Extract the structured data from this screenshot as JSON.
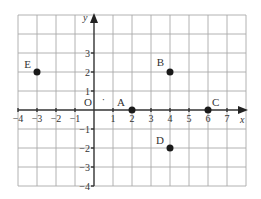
{
  "chart_data": {
    "type": "scatter",
    "title": "",
    "xlabel": "x",
    "ylabel": "y",
    "origin_label": "O",
    "xlim": [
      -4,
      8
    ],
    "ylim": [
      -4,
      5
    ],
    "grid": true,
    "x_ticks": [
      {
        "value": -4,
        "label": "−4"
      },
      {
        "value": -3,
        "label": "−3"
      },
      {
        "value": -2,
        "label": "−2"
      },
      {
        "value": -1,
        "label": "−1"
      },
      {
        "value": 1,
        "label": "1"
      },
      {
        "value": 2,
        "label": "2"
      },
      {
        "value": 3,
        "label": "3"
      },
      {
        "value": 4,
        "label": "4"
      },
      {
        "value": 5,
        "label": "5"
      },
      {
        "value": 6,
        "label": "6"
      },
      {
        "value": 7,
        "label": "7"
      }
    ],
    "y_ticks": [
      {
        "value": 3,
        "label": "3"
      },
      {
        "value": 2,
        "label": "2"
      },
      {
        "value": 1,
        "label": "1"
      },
      {
        "value": -1,
        "label": "−1"
      },
      {
        "value": -2,
        "label": "−2"
      },
      {
        "value": -3,
        "label": "−3"
      },
      {
        "value": -4,
        "label": "−4"
      }
    ],
    "points": [
      {
        "label": "A",
        "x": 2,
        "y": 0
      },
      {
        "label": "B",
        "x": 4,
        "y": 2
      },
      {
        "label": "C",
        "x": 6,
        "y": 0
      },
      {
        "label": "D",
        "x": 4,
        "y": -2
      },
      {
        "label": "E",
        "x": -3,
        "y": 2
      }
    ],
    "annotations": [
      {
        "text": "·",
        "x": 0.5,
        "y": 0.5
      }
    ]
  }
}
